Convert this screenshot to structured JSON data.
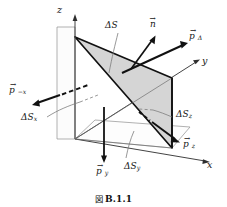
{
  "figure": {
    "caption_symbol": "図",
    "caption_number": "B.1.1",
    "axes": {
      "z": "z",
      "y": "y",
      "x": "x"
    },
    "labels": {
      "delta_s": "ΔS",
      "delta_s_x": "ΔS",
      "delta_s_x_sub": "x",
      "delta_s_y": "ΔS",
      "delta_s_y_sub": "y",
      "delta_s_z": "ΔS",
      "delta_s_z_sub": "z",
      "normal": "n",
      "p_delta": "p",
      "p_delta_sub": "Δ",
      "p_minus_x": "p",
      "p_minus_x_sub": "−x",
      "p_y": "p",
      "p_y_sub": "y",
      "p_z": "p",
      "p_z_sub": "z",
      "vector_arrow": "→"
    }
  },
  "colors": {
    "ink": "#161616",
    "line": "#3a3a3a",
    "face_fill": "#d6d6d6",
    "plane_fill": "#fbfbfb",
    "leader": "#8a8a8a",
    "background": "#ffffff"
  }
}
